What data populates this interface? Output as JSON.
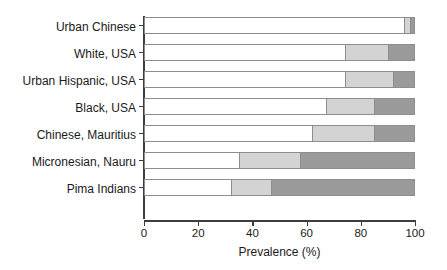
{
  "chart_data": {
    "type": "bar",
    "orientation": "horizontal",
    "stacked": true,
    "title": "",
    "subtitle": "",
    "xlabel": "Prevalence (%)",
    "ylabel": "",
    "xlim": [
      0,
      100
    ],
    "xticks": [
      0,
      20,
      40,
      60,
      80,
      100
    ],
    "xtick_labels": [
      "0",
      "20",
      "40",
      "60",
      "80",
      "100"
    ],
    "grid": false,
    "legend": "none",
    "categories": [
      "Urban Chinese",
      "White, USA",
      "Urban Hispanic, USA",
      "Black, USA",
      "Chinese, Mauritius",
      "Micronesian, Nauru",
      "Pima Indians"
    ],
    "series": [
      {
        "name": "Normal glucose tolerance",
        "color": "#ffffff",
        "values": [
          96.0,
          74.0,
          74.0,
          67.0,
          62.0,
          35.0,
          32.0
        ]
      },
      {
        "name": "Impaired glucose tolerance",
        "color": "#d3d3d3",
        "values": [
          2.0,
          16.0,
          18.0,
          18.0,
          23.0,
          22.5,
          15.0
        ]
      },
      {
        "name": "Diabetes",
        "color": "#9a9a9a",
        "values": [
          2.0,
          10.0,
          8.0,
          15.0,
          15.0,
          42.5,
          53.0
        ]
      }
    ],
    "segment_boundaries_percent": [
      [
        96.0,
        98.0,
        100.0
      ],
      [
        74.0,
        90.0,
        100.0
      ],
      [
        74.0,
        92.0,
        100.0
      ],
      [
        67.0,
        85.0,
        100.0
      ],
      [
        62.0,
        85.0,
        100.0
      ],
      [
        35.0,
        57.5,
        100.0
      ],
      [
        32.0,
        47.0,
        100.0
      ]
    ]
  },
  "colors": {
    "segment_light": "#ffffff",
    "segment_mid": "#d3d3d3",
    "segment_dark": "#9a9a9a",
    "bar_border": "#8d8d8d",
    "axis": "#3d3d3d",
    "text": "#1a1a1a",
    "background": "#ffffff"
  }
}
